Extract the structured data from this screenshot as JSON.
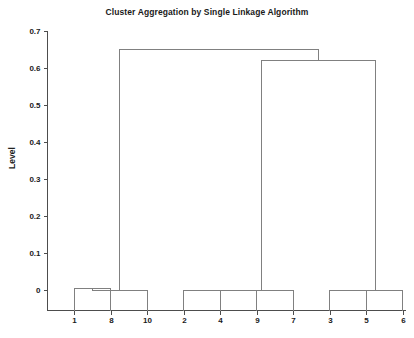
{
  "chart_data": {
    "type": "dendrogram",
    "title": "Cluster Aggregation by Single Linkage Algorithm",
    "xlabel": "",
    "ylabel": "Level",
    "ylim": [
      -0.04,
      0.72
    ],
    "yticks": [
      0,
      0.1,
      0.2,
      0.3,
      0.4,
      0.5,
      0.6,
      0.7
    ],
    "ytick_labels": [
      "0",
      "0.1",
      "0.2",
      "0.3",
      "0.4",
      "0.5",
      "0.6",
      "0.7"
    ],
    "grid": false,
    "legend": "none",
    "leaf_order": [
      1,
      8,
      10,
      2,
      4,
      9,
      7,
      3,
      5,
      6
    ],
    "leaf_labels": [
      "1",
      "8",
      "10",
      "2",
      "4",
      "9",
      "7",
      "3",
      "5",
      "6"
    ],
    "merges": [
      {
        "id": "m1",
        "left": "1",
        "right": "8",
        "level": 0.005
      },
      {
        "id": "m2",
        "left": "m1",
        "right": "10",
        "level": 0.0
      },
      {
        "id": "m3",
        "left": "2",
        "right": "4",
        "level": 0.0
      },
      {
        "id": "m4",
        "left": "m3",
        "right": "9",
        "level": 0.0
      },
      {
        "id": "m5",
        "left": "m4",
        "right": "7",
        "level": 0.0
      },
      {
        "id": "m6",
        "left": "3",
        "right": "5",
        "level": 0.0
      },
      {
        "id": "m7",
        "left": "m6",
        "right": "6",
        "level": 0.0
      },
      {
        "id": "m8",
        "left": "m5",
        "right": "m7",
        "level": 0.62
      },
      {
        "id": "m9",
        "left": "m2",
        "right": "m8",
        "level": 0.65
      }
    ],
    "line_color": "#808080",
    "axis_color": "#4d4d4d",
    "text_color": "#1a1a1a",
    "background_color": "#ffffff"
  }
}
